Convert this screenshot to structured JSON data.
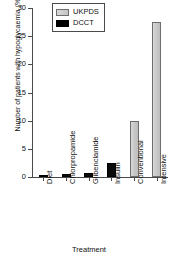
{
  "chart_data": {
    "type": "bar",
    "title": "",
    "xlabel": "Treatment",
    "ylabel": "Number of patients with hypoglycaemia (%)",
    "categories": [
      "Diet",
      "Chlorpropamide",
      "Glibenclamide",
      "Insulin",
      "Conventional",
      "Intensive"
    ],
    "ylim": [
      0,
      30
    ],
    "yticks": [
      0,
      5,
      10,
      15,
      20,
      25,
      30
    ],
    "ytick_labels": [
      "0",
      "5",
      "10",
      "15",
      "20",
      "25",
      "30"
    ],
    "grid": false,
    "legend_position": "top-center",
    "series": [
      {
        "name": "UKPDS",
        "color": "#c9c9c9",
        "values": [
          0,
          0,
          0,
          0,
          10,
          27.5
        ]
      },
      {
        "name": "DCCT",
        "color": "#000000",
        "values": [
          0.15,
          0.6,
          0.7,
          2.4,
          0,
          0
        ]
      }
    ],
    "bars": [
      {
        "category": "Diet",
        "series": "DCCT",
        "value": 0.15
      },
      {
        "category": "Chlorpropamide",
        "series": "DCCT",
        "value": 0.6
      },
      {
        "category": "Glibenclamide",
        "series": "DCCT",
        "value": 0.7
      },
      {
        "category": "Insulin",
        "series": "DCCT",
        "value": 2.4
      },
      {
        "category": "Conventional",
        "series": "UKPDS",
        "value": 10
      },
      {
        "category": "Intensive",
        "series": "UKPDS",
        "value": 27.5
      }
    ]
  },
  "legend": {
    "items": [
      {
        "label": "UKPDS",
        "key": "ukpds"
      },
      {
        "label": "DCCT",
        "key": "dcct"
      }
    ]
  }
}
